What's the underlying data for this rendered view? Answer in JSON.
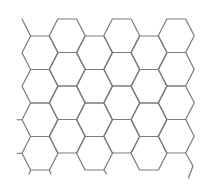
{
  "figure": {
    "type": "hexagonal-grid",
    "orientation": "flat-top",
    "width": 210,
    "height": 187,
    "background": "#ffffff",
    "stroke_color": "#7a7a7a",
    "stroke_width": 1.2
  },
  "grid": {
    "hex_half_width": 18,
    "hex_half_top": 9.4,
    "hex_half_height": 16.75,
    "columns": [
      {
        "cx": 40,
        "centers_y": [
          52.75,
          86.25,
          119.75,
          153.25
        ]
      },
      {
        "cx": 67.25,
        "centers_y": [
          35.75,
          69.25,
          102.75,
          136.25
        ]
      },
      {
        "cx": 94.5,
        "centers_y": [
          52.75,
          86.25,
          119.75,
          153.25
        ]
      },
      {
        "cx": 121.75,
        "centers_y": [
          35.75,
          69.25,
          102.75,
          136.25
        ]
      },
      {
        "cx": 149,
        "centers_y": [
          52.75,
          86.25,
          119.75,
          153.25
        ]
      },
      {
        "cx": 176.25,
        "centers_y": [
          35.75,
          69.25,
          102.75,
          136.25
        ]
      }
    ]
  },
  "stubs": [
    {
      "name": "top-left-stub",
      "points": "30.6,36 22,19"
    },
    {
      "name": "left-stub-row3",
      "points": "22,119.75 17,119.75"
    },
    {
      "name": "left-stub-row4",
      "points": "22,153.25 17,153.25"
    },
    {
      "name": "bottom-stub-col0-left",
      "points": "30.6,170 29,174"
    },
    {
      "name": "bottom-stub-col0-right",
      "points": "49.4,170 51,174"
    },
    {
      "name": "bottom-stub-col2-right",
      "points": "103.9,170 106.5,174"
    },
    {
      "name": "bottom-right-fragment",
      "points": "185.6,153 193,166 188.5,178"
    }
  ]
}
